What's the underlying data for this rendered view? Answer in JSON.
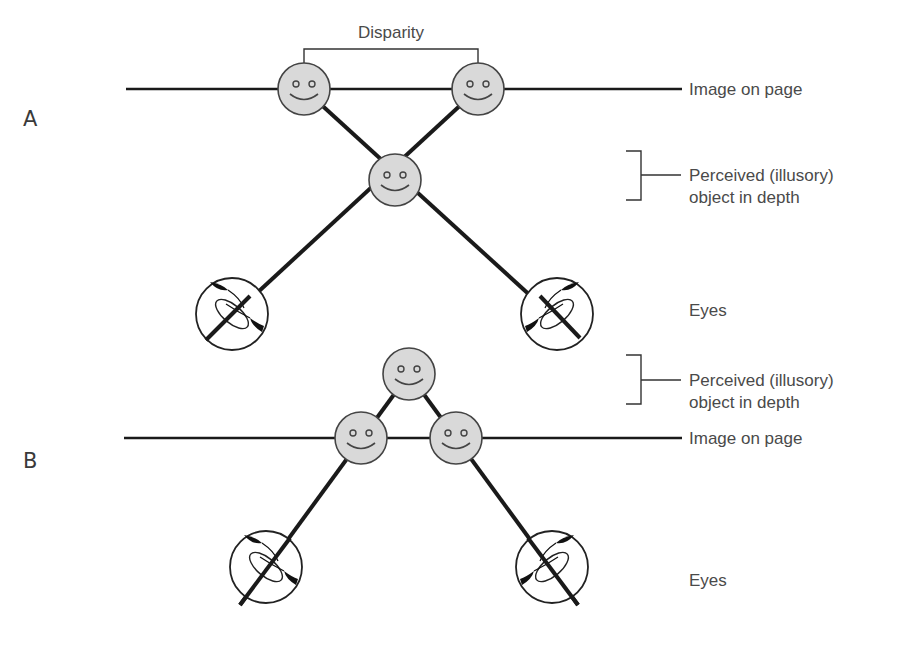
{
  "diagram": {
    "colors": {
      "line": "#1a1a1a",
      "face_fill": "#d9d9d9",
      "face_stroke": "#444444",
      "text": "#4a4a4a"
    },
    "panel_a": {
      "label": "A",
      "disparity_label": "Disparity",
      "image_on_page_label": "Image on page",
      "perceived_label_line1": "Perceived (illusory)",
      "perceived_label_line2": "object in depth",
      "eyes_label": "Eyes",
      "perceived_position": "behind page (crossed lines, between page and eyes)"
    },
    "panel_b": {
      "label": "B",
      "image_on_page_label": "Image on page",
      "perceived_label_line1": "Perceived (illusory)",
      "perceived_label_line2": "object in depth",
      "eyes_label": "Eyes",
      "perceived_position": "beyond page"
    },
    "nodes": [
      {
        "id": "a-left-image",
        "type": "face",
        "x": 304,
        "y": 89
      },
      {
        "id": "a-right-image",
        "type": "face",
        "x": 478,
        "y": 89
      },
      {
        "id": "a-perceived",
        "type": "face",
        "x": 395,
        "y": 180
      },
      {
        "id": "a-left-eye",
        "type": "eye",
        "x": 232,
        "y": 314
      },
      {
        "id": "a-right-eye",
        "type": "eye",
        "x": 557,
        "y": 314
      },
      {
        "id": "b-perceived",
        "type": "face",
        "x": 409,
        "y": 374
      },
      {
        "id": "b-left-image",
        "type": "face",
        "x": 361,
        "y": 438
      },
      {
        "id": "b-right-image",
        "type": "face",
        "x": 456,
        "y": 438
      },
      {
        "id": "b-left-eye",
        "type": "eye",
        "x": 266,
        "y": 567
      },
      {
        "id": "b-right-eye",
        "type": "eye",
        "x": 552,
        "y": 567
      }
    ]
  }
}
